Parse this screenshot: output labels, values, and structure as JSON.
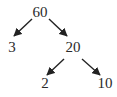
{
  "diagram": {
    "type": "factor-tree",
    "nodes": [
      {
        "id": "n60",
        "label": "60"
      },
      {
        "id": "n3",
        "label": "3"
      },
      {
        "id": "n20",
        "label": "20"
      },
      {
        "id": "n2",
        "label": "2"
      },
      {
        "id": "n10",
        "label": "10"
      }
    ],
    "edges": [
      {
        "from": "n60",
        "to": "n3"
      },
      {
        "from": "n60",
        "to": "n20"
      },
      {
        "from": "n20",
        "to": "n2"
      },
      {
        "from": "n20",
        "to": "n10"
      }
    ]
  }
}
